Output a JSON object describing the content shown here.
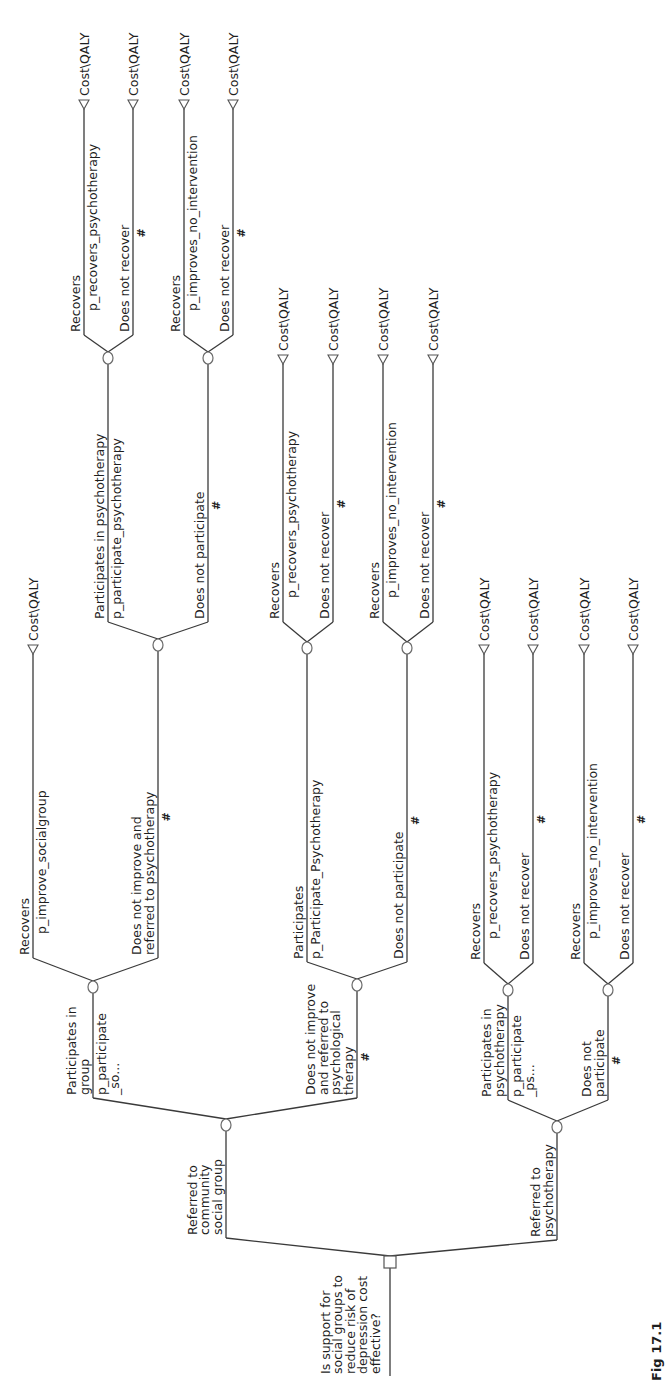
{
  "diagram": {
    "type": "decision-tree",
    "orientation": "rotated-90-ccw",
    "terminal_payoff_label": "Cost\\QALY",
    "complement_symbol": "#",
    "root": {
      "id": "root",
      "kind": "decision",
      "question": [
        "Is support for",
        "social groups to",
        "reduce risk of",
        "depression cost",
        "effective?"
      ],
      "branches": [
        {
          "id": "community",
          "label": [
            "Referred to",
            "community",
            "social group"
          ],
          "kind": "chance",
          "branches": [
            {
              "id": "participates-group",
              "label": [
                "Participates in",
                "group"
              ],
              "prob": [
                "p_participate",
                "_so..."
              ],
              "kind": "chance",
              "branches": [
                {
                  "id": "recovers-sg",
                  "label": [
                    "Recovers"
                  ],
                  "prob": [
                    "p_improve_socialgroup"
                  ],
                  "kind": "terminal"
                },
                {
                  "id": "notimprove-referred",
                  "label": [
                    "Does not improve and",
                    "referred to psychotherapy"
                  ],
                  "prob": [
                    "#"
                  ],
                  "kind": "chance",
                  "branches": [
                    {
                      "id": "participates-psy-a",
                      "label": [
                        "Participates in psychotherapy"
                      ],
                      "prob": [
                        "p_participate_psychotherapy"
                      ],
                      "kind": "chance",
                      "branches": [
                        {
                          "id": "t1",
                          "label": [
                            "Recovers"
                          ],
                          "prob": [
                            "p_recovers_psychotherapy"
                          ],
                          "kind": "terminal"
                        },
                        {
                          "id": "t2",
                          "label": [
                            "Does not recover"
                          ],
                          "prob": [
                            "#"
                          ],
                          "kind": "terminal"
                        }
                      ]
                    },
                    {
                      "id": "notparticipate-a",
                      "label": [
                        "Does not participate"
                      ],
                      "prob": [
                        "#"
                      ],
                      "kind": "chance",
                      "branches": [
                        {
                          "id": "t3",
                          "label": [
                            "Recovers"
                          ],
                          "prob": [
                            "p_improves_no_intervention"
                          ],
                          "kind": "terminal"
                        },
                        {
                          "id": "t4",
                          "label": [
                            "Does not recover"
                          ],
                          "prob": [
                            "#"
                          ],
                          "kind": "terminal"
                        }
                      ]
                    }
                  ]
                }
              ]
            },
            {
              "id": "notimprove-psych",
              "label": [
                "Does not improve",
                "and referred to",
                "psychological",
                "therapy"
              ],
              "prob": [
                "#"
              ],
              "kind": "chance",
              "branches": [
                {
                  "id": "participates-b",
                  "label": [
                    "Participates"
                  ],
                  "prob": [
                    "p_Participate_Psychotherapy"
                  ],
                  "kind": "chance",
                  "branches": [
                    {
                      "id": "t5",
                      "label": [
                        "Recovers"
                      ],
                      "prob": [
                        "p_recovers_psychotherapy"
                      ],
                      "kind": "terminal"
                    },
                    {
                      "id": "t6",
                      "label": [
                        "Does not recover"
                      ],
                      "prob": [
                        "#"
                      ],
                      "kind": "terminal"
                    }
                  ]
                },
                {
                  "id": "notparticipate-b",
                  "label": [
                    "Does not participate"
                  ],
                  "prob": [
                    "#"
                  ],
                  "kind": "chance",
                  "branches": [
                    {
                      "id": "t7",
                      "label": [
                        "Recovers"
                      ],
                      "prob": [
                        "p_improves_no_intervention"
                      ],
                      "kind": "terminal"
                    },
                    {
                      "id": "t8",
                      "label": [
                        "Does not recover"
                      ],
                      "prob": [
                        "#"
                      ],
                      "kind": "terminal"
                    }
                  ]
                }
              ]
            }
          ]
        },
        {
          "id": "psychotherapy",
          "label": [
            "Referred to",
            "psychotherapy"
          ],
          "kind": "chance",
          "branches": [
            {
              "id": "participates-c",
              "label": [
                "Participates in",
                "psychotherapy"
              ],
              "prob": [
                "p_participate",
                "_ps..."
              ],
              "kind": "chance",
              "branches": [
                {
                  "id": "t9",
                  "label": [
                    "Recovers"
                  ],
                  "prob": [
                    "p_recovers_psychotherapy"
                  ],
                  "kind": "terminal"
                },
                {
                  "id": "t10",
                  "label": [
                    "Does not recover"
                  ],
                  "prob": [
                    "#"
                  ],
                  "kind": "terminal"
                }
              ]
            },
            {
              "id": "notparticipate-c",
              "label": [
                "Does not",
                "participate"
              ],
              "prob": [
                "#"
              ],
              "kind": "chance",
              "branches": [
                {
                  "id": "t11",
                  "label": [
                    "Recovers"
                  ],
                  "prob": [
                    "p_improves_no_intervention"
                  ],
                  "kind": "terminal"
                },
                {
                  "id": "t12",
                  "label": [
                    "Does not recover"
                  ],
                  "prob": [
                    "#"
                  ],
                  "kind": "terminal"
                }
              ]
            }
          ]
        }
      ]
    },
    "caption_partial": "Fig 17.1"
  },
  "geometry": {
    "root": {
      "x": 390,
      "y": 1262,
      "stem_end": 1376
    },
    "edges": [
      {
        "ref": "community",
        "jx": 226,
        "jy": 1238,
        "nx": 226,
        "ny": 1125,
        "px": 390,
        "py": 1262,
        "kind": "chance",
        "label_lines": [
          "Referred to",
          "community",
          "social group"
        ],
        "label_side": "left",
        "prob_lines": []
      },
      {
        "ref": "psychotherapy",
        "jx": 557,
        "jy": 1240,
        "nx": 557,
        "ny": 1127,
        "px": 390,
        "py": 1262,
        "kind": "chance",
        "label_lines": [
          "Referred to",
          "psychotherapy"
        ],
        "label_side": "left",
        "prob_lines": []
      },
      {
        "ref": "participates-group",
        "jx": 93,
        "jy": 1098,
        "nx": 93,
        "ny": 987,
        "px": 226,
        "py": 1125,
        "kind": "chance",
        "label_lines": [
          "Participates in",
          "group"
        ],
        "label_side": "left",
        "prob_lines": [
          "p_participate",
          "_so..."
        ]
      },
      {
        "ref": "notimprove-psych",
        "jx": 357,
        "jy": 1098,
        "nx": 357,
        "ny": 985,
        "px": 226,
        "py": 1125,
        "kind": "chance",
        "label_lines": [
          "Does not improve",
          "and referred to",
          "psychological",
          "therapy"
        ],
        "label_side": "left",
        "prob_lines": [
          "#"
        ]
      },
      {
        "ref": "recovers-sg",
        "jx": 33,
        "jy": 958,
        "nx": 33,
        "ny": 645,
        "px": 93,
        "py": 987,
        "kind": "terminal",
        "label_lines": [
          "Recovers"
        ],
        "label_side": "left",
        "prob_lines": [
          "p_improve_socialgroup"
        ]
      },
      {
        "ref": "notimprove-referred",
        "jx": 158,
        "jy": 958,
        "nx": 158,
        "ny": 645,
        "px": 93,
        "py": 987,
        "kind": "chance",
        "label_lines": [
          "Does not improve and",
          "referred to psychotherapy"
        ],
        "label_side": "left",
        "prob_lines": [
          "#"
        ]
      },
      {
        "ref": "participates-psy-a",
        "jx": 108,
        "jy": 622,
        "nx": 108,
        "ny": 358,
        "px": 158,
        "py": 645,
        "kind": "chance",
        "label_lines": [
          "Participates in psychotherapy"
        ],
        "label_side": "left",
        "prob_lines": [
          "p_participate_psychotherapy"
        ]
      },
      {
        "ref": "notparticipate-a",
        "jx": 208,
        "jy": 622,
        "nx": 208,
        "ny": 358,
        "px": 158,
        "py": 645,
        "kind": "chance",
        "label_lines": [
          "Does not participate"
        ],
        "label_side": "left",
        "prob_lines": [
          "#"
        ]
      },
      {
        "ref": "t1",
        "jx": 84,
        "jy": 335,
        "nx": 84,
        "ny": 100,
        "px": 108,
        "py": 358,
        "kind": "terminal",
        "label_lines": [
          "Recovers"
        ],
        "label_side": "left",
        "prob_lines": [
          "p_recovers_psychotherapy"
        ]
      },
      {
        "ref": "t2",
        "jx": 133,
        "jy": 335,
        "nx": 133,
        "ny": 100,
        "px": 108,
        "py": 358,
        "kind": "terminal",
        "label_lines": [
          "Does not recover"
        ],
        "label_side": "left",
        "prob_lines": [
          "#"
        ]
      },
      {
        "ref": "t3",
        "jx": 184,
        "jy": 335,
        "nx": 184,
        "ny": 100,
        "px": 208,
        "py": 358,
        "kind": "terminal",
        "label_lines": [
          "Recovers"
        ],
        "label_side": "left",
        "prob_lines": [
          "p_improves_no_intervention"
        ]
      },
      {
        "ref": "t4",
        "jx": 233,
        "jy": 335,
        "nx": 233,
        "ny": 100,
        "px": 208,
        "py": 358,
        "kind": "terminal",
        "label_lines": [
          "Does not recover"
        ],
        "label_side": "left",
        "prob_lines": [
          "#"
        ]
      },
      {
        "ref": "participates-b",
        "jx": 307,
        "jy": 962,
        "nx": 307,
        "ny": 648,
        "px": 357,
        "py": 985,
        "kind": "chance",
        "label_lines": [
          "Participates"
        ],
        "label_side": "left",
        "prob_lines": [
          "p_Participate_Psychotherapy"
        ]
      },
      {
        "ref": "notparticipate-b",
        "jx": 407,
        "jy": 962,
        "nx": 407,
        "ny": 648,
        "px": 357,
        "py": 985,
        "kind": "chance",
        "label_lines": [
          "Does not participate"
        ],
        "label_side": "left",
        "prob_lines": [
          "#"
        ]
      },
      {
        "ref": "t5",
        "jx": 283,
        "jy": 622,
        "nx": 283,
        "ny": 355,
        "px": 307,
        "py": 648,
        "kind": "terminal",
        "label_lines": [
          "Recovers"
        ],
        "label_side": "left",
        "prob_lines": [
          "p_recovers_psychotherapy"
        ]
      },
      {
        "ref": "t6",
        "jx": 333,
        "jy": 622,
        "nx": 333,
        "ny": 355,
        "px": 307,
        "py": 648,
        "kind": "terminal",
        "label_lines": [
          "Does not recover"
        ],
        "label_side": "left",
        "prob_lines": [
          "#"
        ]
      },
      {
        "ref": "t7",
        "jx": 383,
        "jy": 622,
        "nx": 383,
        "ny": 355,
        "px": 407,
        "py": 648,
        "kind": "terminal",
        "label_lines": [
          "Recovers"
        ],
        "label_side": "left",
        "prob_lines": [
          "p_improves_no_intervention"
        ]
      },
      {
        "ref": "t8",
        "jx": 433,
        "jy": 622,
        "nx": 433,
        "ny": 355,
        "px": 407,
        "py": 648,
        "kind": "terminal",
        "label_lines": [
          "Does not recover"
        ],
        "label_side": "left",
        "prob_lines": [
          "#"
        ]
      },
      {
        "ref": "participates-c",
        "jx": 508,
        "jy": 1100,
        "nx": 508,
        "ny": 990,
        "px": 557,
        "py": 1127,
        "kind": "chance",
        "label_lines": [
          "Participates in",
          "psychotherapy"
        ],
        "label_side": "left",
        "prob_lines": [
          "p_participate",
          "_ps..."
        ]
      },
      {
        "ref": "notparticipate-c",
        "jx": 608,
        "jy": 1100,
        "nx": 608,
        "ny": 990,
        "px": 557,
        "py": 1127,
        "kind": "chance",
        "label_lines": [
          "Does not",
          "participate"
        ],
        "label_side": "left",
        "prob_lines": [
          "#"
        ]
      },
      {
        "ref": "t9",
        "jx": 484,
        "jy": 963,
        "nx": 484,
        "ny": 645,
        "px": 508,
        "py": 990,
        "kind": "terminal",
        "label_lines": [
          "Recovers"
        ],
        "label_side": "left",
        "prob_lines": [
          "p_recovers_psychotherapy"
        ]
      },
      {
        "ref": "t10",
        "jx": 533,
        "jy": 963,
        "nx": 533,
        "ny": 645,
        "px": 508,
        "py": 990,
        "kind": "terminal",
        "label_lines": [
          "Does not recover"
        ],
        "label_side": "left",
        "prob_lines": [
          "#"
        ]
      },
      {
        "ref": "t11",
        "jx": 584,
        "jy": 963,
        "nx": 584,
        "ny": 645,
        "px": 608,
        "py": 990,
        "kind": "terminal",
        "label_lines": [
          "Recovers"
        ],
        "label_side": "left",
        "prob_lines": [
          "p_improves_no_intervention"
        ]
      },
      {
        "ref": "t12",
        "jx": 633,
        "jy": 963,
        "nx": 633,
        "ny": 645,
        "px": 608,
        "py": 990,
        "kind": "terminal",
        "label_lines": [
          "Does not recover"
        ],
        "label_side": "left",
        "prob_lines": [
          "#"
        ]
      }
    ]
  }
}
